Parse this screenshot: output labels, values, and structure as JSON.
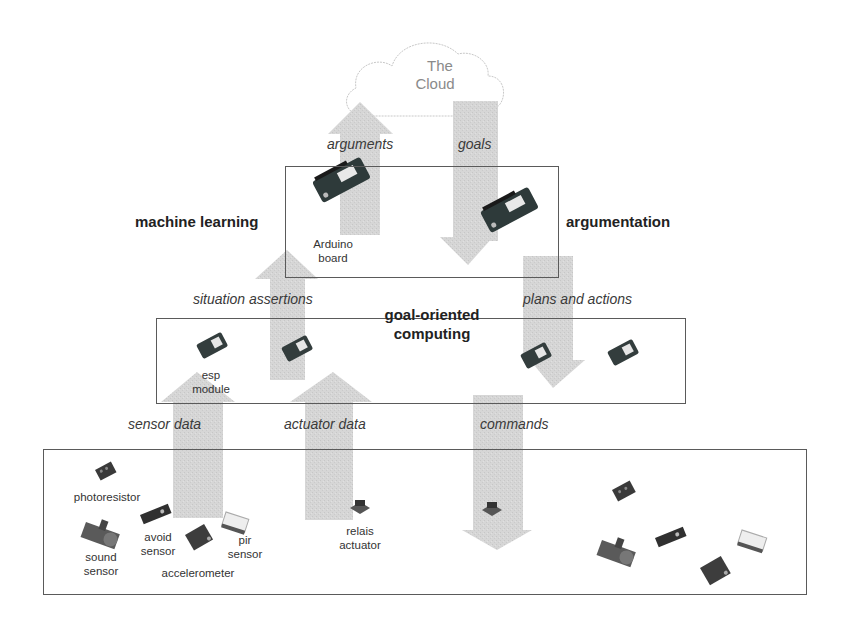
{
  "cloud": {
    "line1": "The",
    "line2": "Cloud"
  },
  "flows": {
    "arguments": "arguments",
    "goals": "goals",
    "situation_assertions": "situation assertions",
    "plans_and_actions": "plans and actions",
    "sensor_data": "sensor data",
    "actuator_data": "actuator data",
    "commands": "commands"
  },
  "layers": {
    "machine_learning": "machine learning",
    "argumentation": "argumentation",
    "goal_oriented_line1": "goal-oriented",
    "goal_oriented_line2": "computing"
  },
  "devices": {
    "arduino_line1": "Arduino",
    "arduino_line2": "board",
    "esp_line1": "esp",
    "esp_line2": "module",
    "photoresistor": "photoresistor",
    "sound_line1": "sound",
    "sound_line2": "sensor",
    "avoid_line1": "avoid",
    "avoid_line2": "sensor",
    "accelerometer": "accelerometer",
    "pir_line1": "pir",
    "pir_line2": "sensor",
    "relais_line1": "relais",
    "relais_line2": "actuator"
  },
  "colors": {
    "arrow_fill": "#d4d4d4",
    "box_border": "#5a5a5a",
    "board_dark": "#2e3a3a",
    "cloud_stroke": "#c8c8c8"
  }
}
